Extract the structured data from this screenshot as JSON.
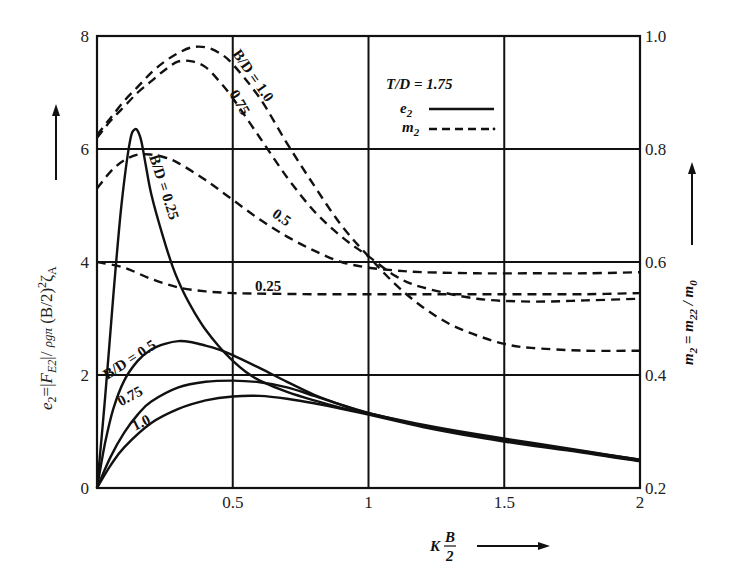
{
  "chart_data": {
    "type": "line",
    "title": "",
    "xlabel": "K B/2",
    "xlabel_parts": {
      "prefix": "K",
      "num": "B",
      "den": "2"
    },
    "ylabel_left": "e2 = |F_E2| / ρgπ (B/2)² ζ_A",
    "ylabel_left_parts": {
      "e": "e",
      "e_sub": "2",
      "eq": "=|",
      "F": "F",
      "F_sub": "E2",
      "mid": "|/ ",
      "rho": "ρgπ",
      "tail": " (B/2)",
      "sq": "2",
      "zeta": "ζ",
      "zeta_sub": "A"
    },
    "ylabel_right": "m2 = m22 / m0",
    "ylabel_right_parts": {
      "m": "m",
      "m_sub": "2",
      "eq": " = ",
      "m22": "m",
      "m22_sub": "22",
      "slash": " / ",
      "m0": "m",
      "m0_sub": "0"
    },
    "xlim": [
      0,
      2
    ],
    "ylim_left": [
      0,
      8
    ],
    "ylim_right": [
      0.2,
      1.0
    ],
    "x_ticks": [
      {
        "v": 0.5,
        "label": "0.5"
      },
      {
        "v": 1,
        "label": "1"
      },
      {
        "v": 1.5,
        "label": "1.5"
      },
      {
        "v": 2,
        "label": "2"
      }
    ],
    "y_left_ticks": [
      {
        "v": 0,
        "label": "0"
      },
      {
        "v": 2,
        "label": "2"
      },
      {
        "v": 4,
        "label": "4"
      },
      {
        "v": 6,
        "label": "6"
      },
      {
        "v": 8,
        "label": "8"
      }
    ],
    "y_right_ticks": [
      {
        "v": 0.2,
        "label": "0.2"
      },
      {
        "v": 0.4,
        "label": "0.4"
      },
      {
        "v": 0.6,
        "label": "0.6"
      },
      {
        "v": 0.8,
        "label": "0.8"
      },
      {
        "v": 1.0,
        "label": "1.0"
      }
    ],
    "grid": true,
    "legend": {
      "position": "upper-center",
      "title": "T/D = 1.75",
      "items": [
        {
          "label": "e2",
          "base": "e",
          "sub": "2",
          "style": "solid"
        },
        {
          "label": "m2",
          "base": "m",
          "sub": "2",
          "style": "dashed"
        }
      ]
    },
    "series": [
      {
        "name": "e2, B/D = 0.25",
        "axis": "left",
        "style": "solid",
        "x": [
          0,
          0.03,
          0.06,
          0.09,
          0.12,
          0.14,
          0.16,
          0.18,
          0.2,
          0.24,
          0.28,
          0.32,
          0.36,
          0.4,
          0.45,
          0.5,
          0.55,
          0.6,
          0.7,
          0.8,
          0.9,
          1.0,
          1.2,
          1.4,
          1.6,
          1.8,
          2.0
        ],
        "y": [
          0,
          1.6,
          3.4,
          5.0,
          6.1,
          6.35,
          6.2,
          5.7,
          5.2,
          4.5,
          3.9,
          3.45,
          3.1,
          2.8,
          2.5,
          2.25,
          2.05,
          1.9,
          1.7,
          1.55,
          1.42,
          1.32,
          1.12,
          0.95,
          0.8,
          0.65,
          0.5
        ]
      },
      {
        "name": "e2, B/D = 0.5",
        "axis": "left",
        "style": "solid",
        "x": [
          0,
          0.03,
          0.06,
          0.1,
          0.15,
          0.2,
          0.25,
          0.3,
          0.35,
          0.4,
          0.45,
          0.5,
          0.6,
          0.7,
          0.8,
          0.9,
          1.0,
          1.2,
          1.4,
          1.6,
          1.8,
          2.0
        ],
        "y": [
          0,
          0.8,
          1.4,
          1.9,
          2.25,
          2.45,
          2.55,
          2.6,
          2.58,
          2.52,
          2.45,
          2.35,
          2.12,
          1.88,
          1.65,
          1.47,
          1.32,
          1.1,
          0.93,
          0.78,
          0.64,
          0.5
        ]
      },
      {
        "name": "e2, B/D = 0.75",
        "axis": "left",
        "style": "solid",
        "x": [
          0,
          0.05,
          0.1,
          0.15,
          0.2,
          0.3,
          0.4,
          0.5,
          0.6,
          0.7,
          0.8,
          0.9,
          1.0,
          1.2,
          1.4,
          1.6,
          1.8,
          2.0
        ],
        "y": [
          0,
          0.55,
          0.98,
          1.3,
          1.53,
          1.78,
          1.88,
          1.9,
          1.87,
          1.78,
          1.63,
          1.47,
          1.33,
          1.1,
          0.92,
          0.77,
          0.63,
          0.48
        ]
      },
      {
        "name": "e2, B/D = 1.0",
        "axis": "left",
        "style": "solid",
        "x": [
          0,
          0.05,
          0.1,
          0.2,
          0.3,
          0.4,
          0.5,
          0.6,
          0.7,
          0.8,
          0.9,
          1.0,
          1.2,
          1.4,
          1.6,
          1.8,
          2.0
        ],
        "y": [
          0,
          0.4,
          0.72,
          1.15,
          1.4,
          1.55,
          1.62,
          1.63,
          1.58,
          1.5,
          1.4,
          1.3,
          1.08,
          0.9,
          0.75,
          0.62,
          0.47
        ]
      },
      {
        "name": "m2, B/D = 0.25",
        "axis": "right",
        "style": "dashed",
        "x": [
          0,
          0.1,
          0.2,
          0.3,
          0.4,
          0.5,
          0.6,
          0.8,
          1.0,
          1.2,
          1.4,
          1.6,
          1.8,
          2.0
        ],
        "y": [
          0.6,
          0.59,
          0.57,
          0.555,
          0.548,
          0.545,
          0.544,
          0.543,
          0.543,
          0.543,
          0.543,
          0.543,
          0.543,
          0.545
        ]
      },
      {
        "name": "m2, B/D = 0.5",
        "axis": "right",
        "style": "dashed",
        "x": [
          0,
          0.05,
          0.1,
          0.15,
          0.2,
          0.25,
          0.3,
          0.4,
          0.5,
          0.6,
          0.7,
          0.8,
          0.9,
          1.0,
          1.1,
          1.2,
          1.4,
          1.6,
          1.8,
          2.0
        ],
        "y": [
          0.73,
          0.76,
          0.78,
          0.79,
          0.79,
          0.785,
          0.775,
          0.745,
          0.71,
          0.675,
          0.645,
          0.62,
          0.6,
          0.59,
          0.585,
          0.582,
          0.58,
          0.58,
          0.58,
          0.582
        ]
      },
      {
        "name": "m2, B/D = 0.75",
        "axis": "right",
        "style": "dashed",
        "x": [
          0,
          0.05,
          0.1,
          0.15,
          0.2,
          0.25,
          0.3,
          0.35,
          0.4,
          0.45,
          0.5,
          0.6,
          0.7,
          0.8,
          0.9,
          1.0,
          1.1,
          1.2,
          1.4,
          1.6,
          1.8,
          2.0
        ],
        "y": [
          0.82,
          0.85,
          0.875,
          0.9,
          0.92,
          0.94,
          0.955,
          0.955,
          0.945,
          0.92,
          0.89,
          0.82,
          0.75,
          0.69,
          0.645,
          0.61,
          0.575,
          0.555,
          0.535,
          0.53,
          0.532,
          0.535
        ]
      },
      {
        "name": "m2, B/D = 1.0",
        "axis": "right",
        "style": "dashed",
        "x": [
          0,
          0.05,
          0.1,
          0.15,
          0.2,
          0.25,
          0.3,
          0.35,
          0.4,
          0.45,
          0.5,
          0.6,
          0.7,
          0.8,
          0.9,
          1.0,
          1.1,
          1.2,
          1.3,
          1.4,
          1.5,
          1.6,
          1.8,
          2.0
        ],
        "y": [
          0.825,
          0.855,
          0.885,
          0.91,
          0.935,
          0.955,
          0.97,
          0.98,
          0.98,
          0.97,
          0.95,
          0.89,
          0.81,
          0.735,
          0.665,
          0.61,
          0.56,
          0.52,
          0.49,
          0.47,
          0.455,
          0.448,
          0.443,
          0.443
        ]
      }
    ],
    "annotations": [
      {
        "text": "B/D = 0.25",
        "x": 0.23,
        "y": 5.3,
        "rotate": 72
      },
      {
        "text": "B/D = 0.5",
        "x": 0.13,
        "y": 2.2,
        "rotate": -33
      },
      {
        "text": "0.75",
        "x": 0.13,
        "y": 1.55,
        "rotate": -28
      },
      {
        "text": "1.0",
        "x": 0.17,
        "y": 1.08,
        "rotate": -26
      },
      {
        "text": "B/D = 1.0",
        "x": 0.56,
        "y": 7.25,
        "rotate": 55
      },
      {
        "text": "0.75",
        "x": 0.51,
        "y": 6.78,
        "rotate": 60
      },
      {
        "text": "0.5",
        "x": 0.67,
        "y": 4.72,
        "rotate": 35
      },
      {
        "text": "0.25",
        "x": 0.63,
        "y": 3.48,
        "rotate": 0
      }
    ]
  }
}
